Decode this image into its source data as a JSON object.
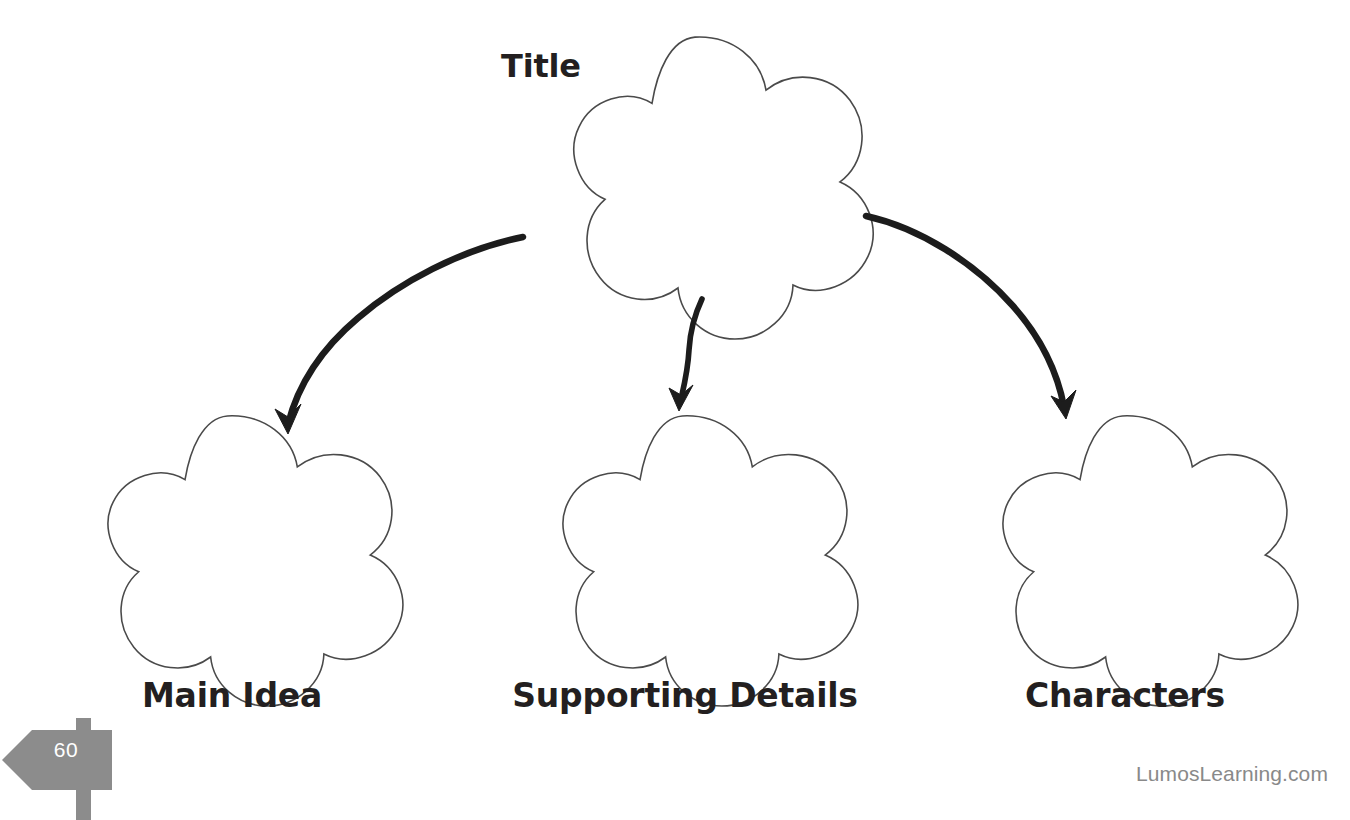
{
  "page": {
    "background_color": "#ffffff",
    "width": 1350,
    "height": 820,
    "top_cropped_text": "Graphic Organizer"
  },
  "organizer": {
    "type": "hierarchy-web",
    "shape": "five-lobed-flower",
    "shape_outline_color": "#4a4a4a",
    "shape_fill_color": "#ffffff",
    "arrow_color": "#1c1c1c",
    "root": {
      "label": "Title",
      "label_position": "left-of-shape-top"
    },
    "children": [
      {
        "label": "Main Idea",
        "label_position": "below-shape"
      },
      {
        "label": "Supporting Details",
        "label_position": "below-shape"
      },
      {
        "label": "Characters",
        "label_position": "below-shape"
      }
    ],
    "connectors": [
      {
        "from": "Title",
        "to": "Main Idea",
        "style": "hand-drawn-curved-arrow",
        "direction": "down-left"
      },
      {
        "from": "Title",
        "to": "Supporting Details",
        "style": "hand-drawn-curved-arrow",
        "direction": "down"
      },
      {
        "from": "Title",
        "to": "Characters",
        "style": "hand-drawn-curved-arrow",
        "direction": "down-right"
      }
    ]
  },
  "footer": {
    "page_number": "60",
    "page_marker_color": "#8c8c8c",
    "page_marker_shape": "left-pointing-signpost",
    "brand": "LumosLearning.com",
    "brand_color": "#898989"
  }
}
